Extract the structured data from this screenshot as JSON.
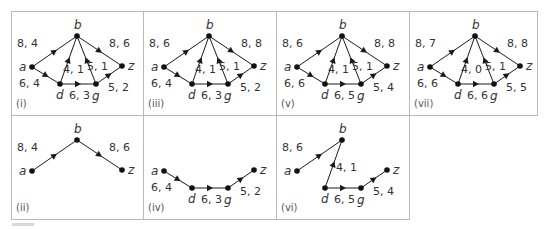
{
  "figure": {
    "grid": {
      "columns": 4,
      "rows": 2
    },
    "colors": {
      "edge": "#1a1a1a",
      "node": "#111111",
      "label": "#333333",
      "frame": "#b9b9b9"
    },
    "node_positions": {
      "a": [
        21,
        56
      ],
      "b": [
        66,
        25
      ],
      "d": [
        49,
        73
      ],
      "g": [
        85,
        73
      ],
      "z": [
        111,
        55
      ]
    },
    "panels": [
      {
        "id": "i",
        "tag": "(i)",
        "col": 0,
        "row": 0,
        "nodes": [
          "a",
          "b",
          "d",
          "g",
          "z"
        ],
        "edges": [
          {
            "from": "a",
            "to": "b",
            "label": "8, 4",
            "lx": 6,
            "ly": 36
          },
          {
            "from": "b",
            "to": "z",
            "label": "8, 6",
            "lx": 98,
            "ly": 36
          },
          {
            "from": "a",
            "to": "d",
            "label": "6, 4",
            "lx": 8,
            "ly": 76
          },
          {
            "from": "d",
            "to": "b",
            "label": "4, 1",
            "lx": 52,
            "ly": 62
          },
          {
            "from": "g",
            "to": "b",
            "label": "5, 1",
            "lx": 76,
            "ly": 59
          },
          {
            "from": "d",
            "to": "g",
            "label": "6, 3",
            "lx": 58,
            "ly": 88
          },
          {
            "from": "g",
            "to": "z",
            "label": "5, 2",
            "lx": 97,
            "ly": 80
          }
        ]
      },
      {
        "id": "iii",
        "tag": "(iii)",
        "col": 1,
        "row": 0,
        "nodes": [
          "a",
          "b",
          "d",
          "g",
          "z"
        ],
        "edges": [
          {
            "from": "a",
            "to": "b",
            "label": "8, 6",
            "lx": 6,
            "ly": 36
          },
          {
            "from": "b",
            "to": "z",
            "label": "8, 8",
            "lx": 98,
            "ly": 36
          },
          {
            "from": "a",
            "to": "d",
            "label": "6, 4",
            "lx": 8,
            "ly": 76
          },
          {
            "from": "d",
            "to": "b",
            "label": "4, 1",
            "lx": 52,
            "ly": 62
          },
          {
            "from": "g",
            "to": "b",
            "label": "5, 1",
            "lx": 76,
            "ly": 59
          },
          {
            "from": "d",
            "to": "g",
            "label": "6, 3",
            "lx": 58,
            "ly": 88
          },
          {
            "from": "g",
            "to": "z",
            "label": "5, 2",
            "lx": 97,
            "ly": 80
          }
        ]
      },
      {
        "id": "v",
        "tag": "(v)",
        "col": 2,
        "row": 0,
        "nodes": [
          "a",
          "b",
          "d",
          "g",
          "z"
        ],
        "edges": [
          {
            "from": "a",
            "to": "b",
            "label": "8, 6",
            "lx": 6,
            "ly": 36
          },
          {
            "from": "b",
            "to": "z",
            "label": "8, 8",
            "lx": 98,
            "ly": 36
          },
          {
            "from": "a",
            "to": "d",
            "label": "6, 6",
            "lx": 8,
            "ly": 76
          },
          {
            "from": "d",
            "to": "b",
            "label": "4, 1",
            "lx": 52,
            "ly": 62
          },
          {
            "from": "g",
            "to": "b",
            "label": "5, 1",
            "lx": 76,
            "ly": 59
          },
          {
            "from": "d",
            "to": "g",
            "label": "6, 5",
            "lx": 58,
            "ly": 88
          },
          {
            "from": "g",
            "to": "z",
            "label": "5, 4",
            "lx": 97,
            "ly": 80
          }
        ]
      },
      {
        "id": "vii",
        "tag": "(vii)",
        "col": 3,
        "row": 0,
        "nodes": [
          "a",
          "b",
          "d",
          "g",
          "z"
        ],
        "edges": [
          {
            "from": "a",
            "to": "b",
            "label": "8, 7",
            "lx": 6,
            "ly": 36
          },
          {
            "from": "b",
            "to": "z",
            "label": "8, 8",
            "lx": 98,
            "ly": 36
          },
          {
            "from": "a",
            "to": "d",
            "label": "6, 6",
            "lx": 8,
            "ly": 76
          },
          {
            "from": "d",
            "to": "b",
            "label": "4, 0",
            "lx": 52,
            "ly": 62
          },
          {
            "from": "g",
            "to": "b",
            "label": "5, 1",
            "lx": 76,
            "ly": 59
          },
          {
            "from": "d",
            "to": "g",
            "label": "6, 6",
            "lx": 58,
            "ly": 88
          },
          {
            "from": "g",
            "to": "z",
            "label": "5, 5",
            "lx": 97,
            "ly": 80
          }
        ]
      },
      {
        "id": "ii",
        "tag": "(ii)",
        "col": 0,
        "row": 1,
        "nodes": [
          "a",
          "b",
          "z"
        ],
        "edges": [
          {
            "from": "a",
            "to": "b",
            "label": "8, 4",
            "lx": 6,
            "ly": 36
          },
          {
            "from": "b",
            "to": "z",
            "label": "8, 6",
            "lx": 98,
            "ly": 36
          }
        ]
      },
      {
        "id": "iv",
        "tag": "(iv)",
        "col": 1,
        "row": 1,
        "nodes": [
          "a",
          "d",
          "g",
          "z"
        ],
        "edges": [
          {
            "from": "a",
            "to": "d",
            "label": "6, 4",
            "lx": 8,
            "ly": 76
          },
          {
            "from": "d",
            "to": "g",
            "label": "6, 3",
            "lx": 58,
            "ly": 88
          },
          {
            "from": "g",
            "to": "z",
            "label": "5, 2",
            "lx": 97,
            "ly": 80
          }
        ]
      },
      {
        "id": "vi",
        "tag": "(vi)",
        "col": 2,
        "row": 1,
        "nodes": [
          "a",
          "b",
          "d",
          "g",
          "z"
        ],
        "edges": [
          {
            "from": "a",
            "to": "b",
            "label": "8, 6",
            "lx": 6,
            "ly": 36
          },
          {
            "from": "d",
            "to": "b",
            "label": "4, 1",
            "lx": 60,
            "ly": 56
          },
          {
            "from": "d",
            "to": "g",
            "label": "6, 5",
            "lx": 58,
            "ly": 88
          },
          {
            "from": "g",
            "to": "z",
            "label": "5, 4",
            "lx": 97,
            "ly": 80
          }
        ]
      }
    ]
  }
}
